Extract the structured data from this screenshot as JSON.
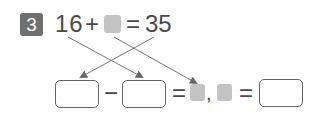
{
  "problem": {
    "number": "3",
    "equation": {
      "left_operand": "16",
      "operator": "+",
      "unknown": "blank-square",
      "equals": "=",
      "result": "35"
    }
  },
  "answer_row": {
    "minus": "−",
    "equals1": "=",
    "comma": ",",
    "equals2": "=",
    "boxes": [
      "",
      "",
      ""
    ]
  },
  "colors": {
    "badge": "#6f6f6f",
    "blank_square": "#c3c3c3",
    "text": "#4a4a4a",
    "arrow": "#666666"
  }
}
